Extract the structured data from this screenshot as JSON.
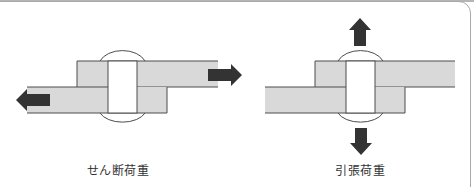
{
  "panels": [
    {
      "id": "shear",
      "label": "せん断荷重",
      "load_direction": "horizontal (plates pulled apart in opposite directions)"
    },
    {
      "id": "tension",
      "label": "引張荷重",
      "load_direction": "vertical (rivet pulled up and down)"
    }
  ],
  "colors": {
    "plate_fill": "#d9d9d9",
    "outline": "#4d4d4d",
    "arrow": "#333333",
    "rivet_fill": "#ffffff",
    "frame": "#a9a9a9"
  }
}
